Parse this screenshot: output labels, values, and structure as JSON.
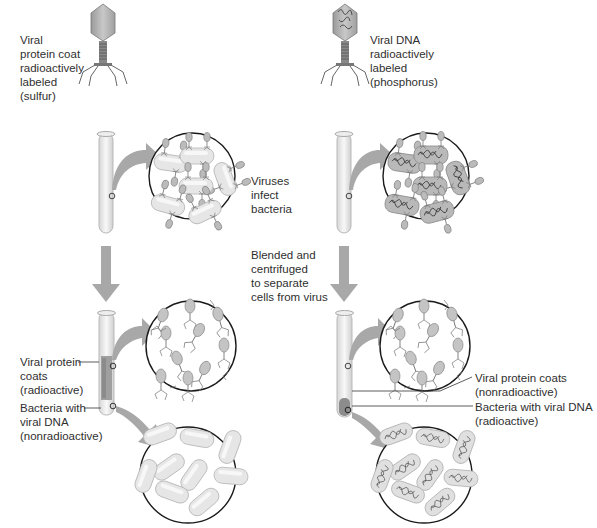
{
  "left_experiment": {
    "phage_label": "Viral\nprotein coat\nradioactively\nlabeled\n(sulfur)",
    "supernatant_label": "Viral protein\ncoats\n(radioactive)",
    "pellet_label": "Bacteria with\nviral DNA\n(nonradioactive)"
  },
  "right_experiment": {
    "phage_label": "Viral DNA\nradioactively\nlabeled\n(phosphorus)",
    "supernatant_label": "Viral protein coats\n(nonradioactive)",
    "pellet_label": "Bacteria with viral DNA\n(radioactive)"
  },
  "steps": {
    "infect": "Viruses\ninfect\nbacteria",
    "blend": "Blended and\ncentrifuged\nto separate\ncells from virus"
  },
  "colors": {
    "arrow": "#a8a8a8",
    "capsid": "#b8b8b8",
    "bacterium": "#e4e4e4",
    "outline": "#1a1a1a"
  }
}
